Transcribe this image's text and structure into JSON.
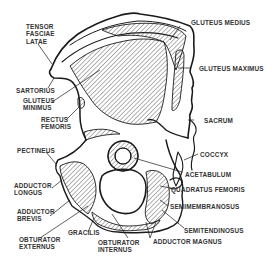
{
  "diagram": {
    "colors": {
      "line": "#1a1a1a",
      "hatch": "#444444",
      "text": "#333333",
      "background": "#ffffff"
    },
    "labels": {
      "tensor_fasciae_latae": "TENSOR\nFASCIAE\nLATAE",
      "sartorius": "SARTORIUS",
      "gluteus_minimus": "GLUTEUS\nMINIMUS",
      "rectus_femoris": "RECTUS\nFEMORIS",
      "pectineus": "PECTINEUS",
      "adductor_longus": "ADDUCTOR\nLONGUS",
      "adductor_brevis": "ADDUCTOR\nBREVIS",
      "obturator_externus": "OBTURATOR\nEXTERNUS",
      "gracilis": "GRACILIS",
      "obturator_internus": "OBTURATOR\nINTERNUS",
      "gluteus_medius": "GLUTEUS MEDIUS",
      "gluteus_maximus": "GLUTEUS MAXIMUS",
      "sacrum": "SACRUM",
      "coccyx": "COCCYX",
      "acetabulum": "ACETABULUM",
      "quadratus_femoris": "QUADRATUS FEMORIS",
      "semimembranosus": "SEMIMEMBRANOSUS",
      "semitendinosus": "SEMITENDINOSUS",
      "adductor_magnus": "ADDUCTOR MAGNUS"
    }
  }
}
